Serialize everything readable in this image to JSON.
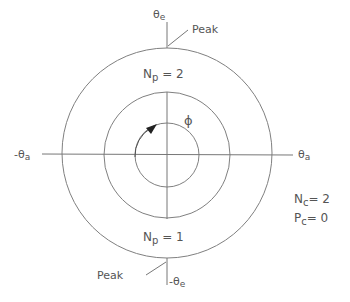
{
  "diagram": {
    "type": "polar-angle-diagram",
    "center": {
      "x": 167,
      "y": 154
    },
    "circles": [
      {
        "name": "outer",
        "radius": 105
      },
      {
        "name": "middle",
        "radius": 63
      },
      {
        "name": "inner",
        "radius": 32
      }
    ],
    "axis_labels": {
      "top": {
        "main": "θ",
        "sub": "e"
      },
      "bottom": {
        "main": "-θ",
        "sub": "e"
      },
      "left": {
        "main": "-θ",
        "sub": "a"
      },
      "right": {
        "main": "θ",
        "sub": "a"
      }
    },
    "peak_top": "Peak",
    "peak_bottom": "Peak",
    "region_top": {
      "main": "N",
      "sub": "p",
      "rest": " = 2"
    },
    "region_bottom": {
      "main": "N",
      "sub": "p",
      "rest": " = 1"
    },
    "phi_label": "ϕ",
    "params": {
      "nc": {
        "main": "N",
        "sub": "c",
        "rest": "= 2"
      },
      "pc": {
        "main": "P",
        "sub": "c",
        "rest": "= 0"
      }
    },
    "line_color": "#777777",
    "text_color": "#555555"
  }
}
